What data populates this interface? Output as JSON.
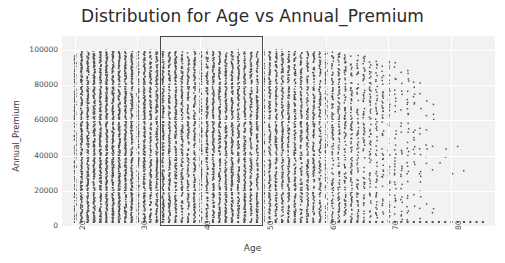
{
  "chart_data": {
    "type": "scatter",
    "title": "Distribution for Age vs Annual_Premium",
    "xlabel": "Age",
    "ylabel": "Annual_Premium",
    "xlim": [
      18,
      87
    ],
    "ylim": [
      0,
      108000
    ],
    "grid": true,
    "legend": null,
    "point_color": "#4d4d4d",
    "plot_bg_color": "#f2f2f2",
    "x_tick_labels": [
      "20",
      "30",
      "40",
      "50",
      "60",
      "70",
      "80"
    ],
    "x_tick_values": [
      20,
      30,
      40,
      50,
      60,
      70,
      80
    ],
    "x_tick_rotation": 90,
    "y_tick_labels": [
      "0",
      "20000",
      "40000",
      "60000",
      "80000",
      "100000"
    ],
    "y_tick_values": [
      0,
      20000,
      40000,
      60000,
      80000,
      100000
    ],
    "annotations": [
      {
        "name": "selection-rectangle",
        "type": "rect",
        "x_range": [
          38,
          50
        ],
        "y_range": [
          0,
          108000
        ],
        "edge_color": "#4a4a4a",
        "fill": "none"
      }
    ],
    "series": [
      {
        "name": "Annual_Premium",
        "x_min": 20,
        "x_max": 85,
        "y_min": 2630,
        "y_max": 100000,
        "baseline_y": 2630,
        "density_by_age": [
          {
            "age": 20,
            "density": 0.88,
            "top": 98000
          },
          {
            "age": 21,
            "density": 0.95,
            "top": 100000
          },
          {
            "age": 22,
            "density": 0.97,
            "top": 100000
          },
          {
            "age": 23,
            "density": 0.98,
            "top": 100000
          },
          {
            "age": 24,
            "density": 0.99,
            "top": 100000
          },
          {
            "age": 25,
            "density": 0.99,
            "top": 100000
          },
          {
            "age": 26,
            "density": 0.98,
            "top": 100000
          },
          {
            "age": 27,
            "density": 0.97,
            "top": 100000
          },
          {
            "age": 28,
            "density": 0.96,
            "top": 100000
          },
          {
            "age": 29,
            "density": 0.95,
            "top": 100000
          },
          {
            "age": 30,
            "density": 0.94,
            "top": 100000
          },
          {
            "age": 31,
            "density": 0.93,
            "top": 100000
          },
          {
            "age": 32,
            "density": 0.92,
            "top": 100000
          },
          {
            "age": 33,
            "density": 0.92,
            "top": 100000
          },
          {
            "age": 34,
            "density": 0.91,
            "top": 100000
          },
          {
            "age": 35,
            "density": 0.9,
            "top": 100000
          },
          {
            "age": 36,
            "density": 0.89,
            "top": 100000
          },
          {
            "age": 37,
            "density": 0.84,
            "top": 99000
          },
          {
            "age": 38,
            "density": 0.8,
            "top": 99000
          },
          {
            "age": 39,
            "density": 0.86,
            "top": 100000
          },
          {
            "age": 40,
            "density": 0.89,
            "top": 100000
          },
          {
            "age": 41,
            "density": 0.9,
            "top": 100000
          },
          {
            "age": 42,
            "density": 0.9,
            "top": 100000
          },
          {
            "age": 43,
            "density": 0.9,
            "top": 100000
          },
          {
            "age": 44,
            "density": 0.89,
            "top": 100000
          },
          {
            "age": 45,
            "density": 0.89,
            "top": 100000
          },
          {
            "age": 46,
            "density": 0.88,
            "top": 100000
          },
          {
            "age": 47,
            "density": 0.88,
            "top": 100000
          },
          {
            "age": 48,
            "density": 0.88,
            "top": 100000
          },
          {
            "age": 49,
            "density": 0.87,
            "top": 100000
          },
          {
            "age": 50,
            "density": 0.87,
            "top": 100000
          },
          {
            "age": 51,
            "density": 0.86,
            "top": 100000
          },
          {
            "age": 52,
            "density": 0.85,
            "top": 100000
          },
          {
            "age": 53,
            "density": 0.85,
            "top": 100000
          },
          {
            "age": 54,
            "density": 0.84,
            "top": 100000
          },
          {
            "age": 55,
            "density": 0.83,
            "top": 100000
          },
          {
            "age": 56,
            "density": 0.82,
            "top": 100000
          },
          {
            "age": 57,
            "density": 0.81,
            "top": 100000
          },
          {
            "age": 58,
            "density": 0.8,
            "top": 100000
          },
          {
            "age": 59,
            "density": 0.79,
            "top": 100000
          },
          {
            "age": 60,
            "density": 0.78,
            "top": 100000
          },
          {
            "age": 61,
            "density": 0.74,
            "top": 99000
          },
          {
            "age": 62,
            "density": 0.72,
            "top": 99000
          },
          {
            "age": 63,
            "density": 0.7,
            "top": 98000
          },
          {
            "age": 64,
            "density": 0.66,
            "top": 98000
          },
          {
            "age": 65,
            "density": 0.62,
            "top": 97000
          },
          {
            "age": 66,
            "density": 0.58,
            "top": 97000
          },
          {
            "age": 67,
            "density": 0.55,
            "top": 96000
          },
          {
            "age": 68,
            "density": 0.52,
            "top": 95000
          },
          {
            "age": 69,
            "density": 0.5,
            "top": 95000
          },
          {
            "age": 70,
            "density": 0.47,
            "top": 94000
          },
          {
            "age": 71,
            "density": 0.43,
            "top": 93000
          },
          {
            "age": 72,
            "density": 0.4,
            "top": 92000
          },
          {
            "age": 73,
            "density": 0.36,
            "top": 90000
          },
          {
            "age": 74,
            "density": 0.32,
            "top": 88000
          },
          {
            "age": 75,
            "density": 0.28,
            "top": 85000
          },
          {
            "age": 76,
            "density": 0.22,
            "top": 80000
          },
          {
            "age": 77,
            "density": 0.17,
            "top": 72000
          },
          {
            "age": 78,
            "density": 0.13,
            "top": 64000
          },
          {
            "age": 79,
            "density": 0.1,
            "top": 58000
          },
          {
            "age": 80,
            "density": 0.08,
            "top": 52000
          },
          {
            "age": 81,
            "density": 0.06,
            "top": 46000
          },
          {
            "age": 82,
            "density": 0.05,
            "top": 42000
          },
          {
            "age": 83,
            "density": 0.04,
            "top": 38000
          },
          {
            "age": 84,
            "density": 0.03,
            "top": 34000
          },
          {
            "age": 85,
            "density": 0.02,
            "top": 30000
          }
        ]
      }
    ]
  }
}
